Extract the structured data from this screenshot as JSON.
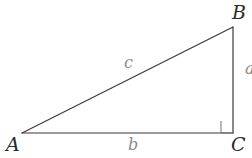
{
  "figure": {
    "kind": "right-triangle-diagram",
    "width": 252,
    "height": 158,
    "background_color": "#ffffff",
    "stroke_color": "#3a3a3a",
    "stroke_width": 1.2,
    "vertex_label_color": "#2a2a2a",
    "side_label_color": "#8c8c8c"
  },
  "vertices": {
    "a": {
      "label": "A",
      "x": 22,
      "y": 133
    },
    "b": {
      "label": "B",
      "x": 233,
      "y": 27
    },
    "c": {
      "label": "C",
      "x": 233,
      "y": 133
    }
  },
  "sides": {
    "hypotenuse": {
      "label": "c",
      "from": "A",
      "to": "B"
    },
    "base": {
      "label": "b",
      "from": "A",
      "to": "C"
    },
    "vertical": {
      "label": "a",
      "from": "B",
      "to": "C"
    }
  },
  "right_angle": {
    "at_vertex": "C",
    "marker_size": 12,
    "marker_x": 221,
    "marker_y": 121
  }
}
